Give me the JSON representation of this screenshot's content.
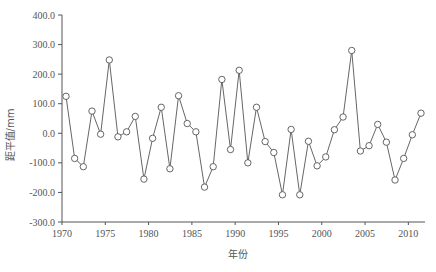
{
  "chart_data": {
    "type": "line",
    "title": "",
    "xlabel": "年份",
    "ylabel": "距平值/mm",
    "ylim": [
      -300,
      400
    ],
    "xlim": [
      1970,
      2011
    ],
    "grid": false,
    "legend": null,
    "y_ticks": [
      "400.0",
      "300.0",
      "200.0",
      "100.0",
      "0.0",
      "-100.0",
      "-200.0",
      "-300.0"
    ],
    "x_ticks": [
      "1970",
      "1975",
      "1980",
      "1985",
      "1990",
      "1995",
      "2000",
      "2005",
      "2010"
    ],
    "marker": "open-circle",
    "line_color": "#555555",
    "x": [
      1970,
      1971,
      1972,
      1973,
      1974,
      1975,
      1976,
      1977,
      1978,
      1979,
      1980,
      1981,
      1982,
      1983,
      1984,
      1985,
      1986,
      1987,
      1988,
      1989,
      1990,
      1991,
      1992,
      1993,
      1994,
      1995,
      1996,
      1997,
      1998,
      1999,
      2000,
      2001,
      2002,
      2003,
      2004,
      2005,
      2006,
      2007,
      2008,
      2009,
      2010,
      2011
    ],
    "series": [
      {
        "name": "距平值",
        "values": [
          125,
          -85,
          -113,
          75,
          -3,
          248,
          -12,
          5,
          57,
          -155,
          -17,
          88,
          -120,
          127,
          33,
          5,
          -182,
          -113,
          182,
          -55,
          213,
          -100,
          88,
          -28,
          -65,
          -208,
          13,
          -208,
          -27,
          -110,
          -80,
          12,
          55,
          280,
          -60,
          -42,
          30,
          -30,
          -158,
          -85,
          -5,
          68
        ]
      }
    ]
  }
}
